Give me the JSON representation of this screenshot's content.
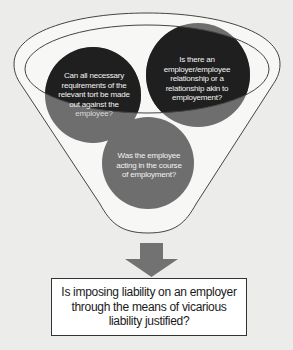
{
  "diagram": {
    "type": "funnel",
    "colors": {
      "background": "#ececea",
      "funnel_fill": "#f7f7f5",
      "funnel_stroke": "#444444",
      "dark_circle": "#1f1f1f",
      "gray_circle": "#6e6e6e",
      "arrow": "#727272",
      "box_border": "#333333"
    },
    "funnel_circles": [
      {
        "id": "tort",
        "text_lines": [
          "Can all necessary",
          "requirements of the",
          "relevant tort be made",
          "out against the",
          "employee?"
        ]
      },
      {
        "id": "relationship",
        "text_lines": [
          "Is there an",
          "employer/employee",
          "relationship or a",
          "relationship akin to",
          "employement?"
        ]
      },
      {
        "id": "course",
        "text_lines": [
          "Was the employee",
          "acting in the course",
          "of employment?"
        ]
      }
    ],
    "arrow": {
      "direction": "down",
      "icon": "down-arrow-icon"
    },
    "result": {
      "text": "Is imposing liability on an employer through the means of vicarious liability justified?"
    }
  }
}
